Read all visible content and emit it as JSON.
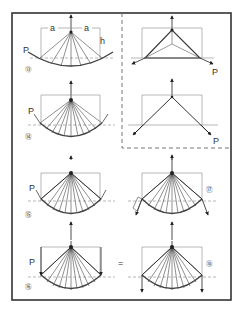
{
  "figure": {
    "labels": {
      "load": "P",
      "span_a": "a",
      "height_h": "h",
      "equals": "="
    },
    "panels": [
      {
        "id": "13",
        "number": "⑬",
        "desc": "suspended cable with radial struts, loads P at ends"
      },
      {
        "id": "14",
        "number": "⑭",
        "desc": "suspended cable, denser struts"
      },
      {
        "id": "15",
        "number": "⑮",
        "desc": "fan arch with cable, loads P"
      },
      {
        "id": "16",
        "number": "⑯",
        "desc": "fan arch, vertical loads P"
      },
      {
        "id": "17",
        "number": "⑰",
        "desc": "fan arch, inclined reactions"
      },
      {
        "id": "18",
        "number": "⑱",
        "desc": "fan arch, vertical reactions (equivalent)"
      },
      {
        "id": "tri1",
        "number": "",
        "desc": "triangular truss with load P"
      },
      {
        "id": "tri2",
        "number": "",
        "desc": "Y-shaped strut system with load P"
      }
    ]
  }
}
